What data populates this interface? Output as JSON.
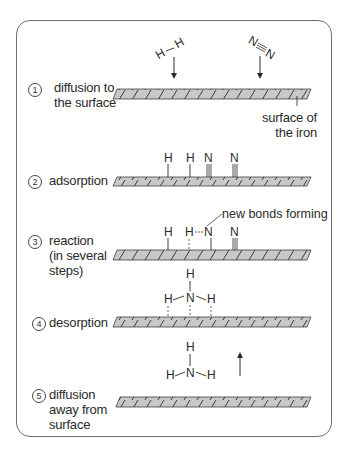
{
  "diagram": {
    "colors": {
      "surface_fill": "#c8c8c8",
      "line": "#2a2a2a",
      "frame": "#6e6e6e"
    },
    "steps": [
      {
        "number": "1",
        "label_lines": [
          "diffusion to",
          "the surface"
        ]
      },
      {
        "number": "2",
        "label_lines": [
          "adsorption"
        ]
      },
      {
        "number": "3",
        "label_lines": [
          "reaction",
          "(in several",
          "steps)"
        ]
      },
      {
        "number": "4",
        "label_lines": [
          "desorption"
        ]
      },
      {
        "number": "5",
        "label_lines": [
          "diffusion",
          "away from",
          "surface"
        ]
      }
    ],
    "annotations": {
      "surface_label_lines": [
        "surface of",
        "the iron"
      ],
      "new_bonds": "new bonds forming"
    },
    "atoms": {
      "H": "H",
      "N": "N"
    }
  }
}
